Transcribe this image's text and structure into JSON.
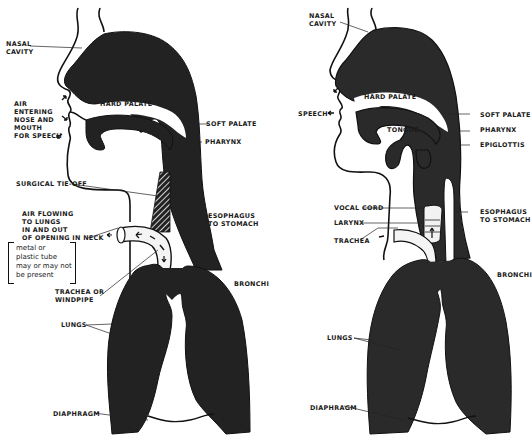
{
  "figure": {
    "left_panel": {
      "title": "Laryngectomy airway",
      "labels": {
        "nasal_cavity": "NASAL\nCAVITY",
        "air_entering": "AIR\nENTERING\nNOSE AND\nMOUTH\nFOR SPEECH",
        "hard_palate": "HARD PALATE",
        "soft_palate": "SOFT PALATE",
        "pharynx": "PHARYNX",
        "surgical_tie_off": "SURGICAL TIE-OFF",
        "air_flowing": "AIR FLOWING\nTO LUNGS\nIN AND OUT\nOF OPENING IN NECK",
        "tube_note": "metal or\nplastic tube\nmay or may not\nbe present",
        "esophagus": "ESOPHAGUS\nTO STOMACH",
        "trachea": "TRACHEA OR\nWINDPIPE",
        "bronchi": "BRONCHI",
        "lungs": "LUNGS",
        "diaphragm": "DIAPHRAGM"
      }
    },
    "right_panel": {
      "title": "Normal airway",
      "labels": {
        "nasal_cavity": "NASAL\nCAVITY",
        "speech": "SPEECH",
        "hard_palate": "HARD PALATE",
        "soft_palate": "SOFT PALATE",
        "tongue": "TONGUE",
        "pharynx": "PHARYNX",
        "epiglottis": "EPIGLOTTIS",
        "vocal_cord": "VOCAL CORD",
        "larynx": "LARYNX",
        "trachea": "TRACHEA",
        "esophagus": "ESOPHAGUS\nTO STOMACH",
        "bronchi": "BRONCHI",
        "lungs": "LUNGS",
        "diaphragm": "DIAPHRAGM"
      }
    },
    "colors": {
      "tissue": "#222222",
      "outline": "#111111",
      "background": "#ffffff",
      "hatch": "#ffffff"
    }
  }
}
